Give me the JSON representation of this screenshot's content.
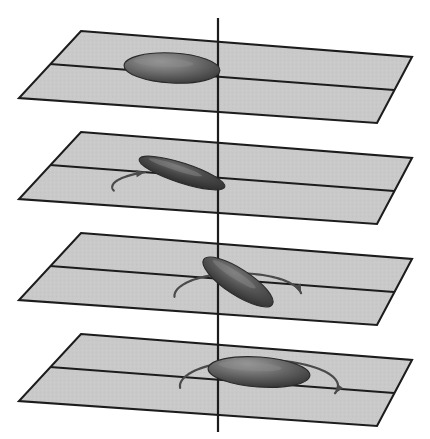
{
  "figure": {
    "canvas": {
      "width": 430,
      "height": 439,
      "background": "#ffffff"
    },
    "colors": {
      "plane_fill": "#c9c9c9",
      "plane_edge": "#1c1c1c",
      "axis": "#1c1c1c",
      "arrow": "#4a4a4a",
      "disc_dark": "#2b2b2b",
      "disc_light": "#8e8e8e"
    },
    "axis": {
      "label": "vertical-axis",
      "x": 218,
      "y_top": 18,
      "y_bottom": 432
    },
    "plane_shape": {
      "top_left": [
        81,
        31
      ],
      "top_right": [
        412,
        57
      ],
      "bottom_right": [
        377,
        123
      ],
      "bottom_left": [
        19,
        98
      ],
      "mid_left": [
        50,
        64
      ],
      "mid_right": [
        394,
        90
      ]
    },
    "panel_spacing": 101,
    "panels": [
      {
        "index": 1,
        "name": "panel-top",
        "offset_y": 0,
        "disc": {
          "cx": 172,
          "cy": 68,
          "rx": 48,
          "ry": 15,
          "rotation_deg": 3,
          "state": "horizontal-disc-left-of-axis"
        },
        "arrow": {
          "visible": false,
          "sweep_deg": 0
        }
      },
      {
        "index": 2,
        "name": "panel-second",
        "offset_y": 101,
        "disc": {
          "cx": 182,
          "cy": 173,
          "rx": 45,
          "ry": 10,
          "rotation_deg": 18,
          "state": "tilted-disc-rising-to-axis"
        },
        "arrow": {
          "visible": true,
          "sweep_deg": 70,
          "start_deg": 168,
          "end_deg": 238
        }
      },
      {
        "index": 3,
        "name": "panel-third",
        "offset_y": 202,
        "disc": {
          "cx": 238,
          "cy": 282,
          "rx": 41,
          "ry": 13,
          "rotation_deg": 33,
          "state": "tilted-disc-right-of-axis"
        },
        "arrow": {
          "visible": true,
          "sweep_deg": 175,
          "start_deg": 178,
          "end_deg": 353
        }
      },
      {
        "index": 4,
        "name": "panel-bottom",
        "offset_y": 303,
        "disc": {
          "cx": 259,
          "cy": 372,
          "rx": 51,
          "ry": 15,
          "rotation_deg": 4,
          "state": "horizontal-disc-right-of-axis"
        },
        "arrow": {
          "visible": true,
          "sweep_deg": 200,
          "start_deg": 176,
          "end_deg": 376
        }
      }
    ]
  }
}
